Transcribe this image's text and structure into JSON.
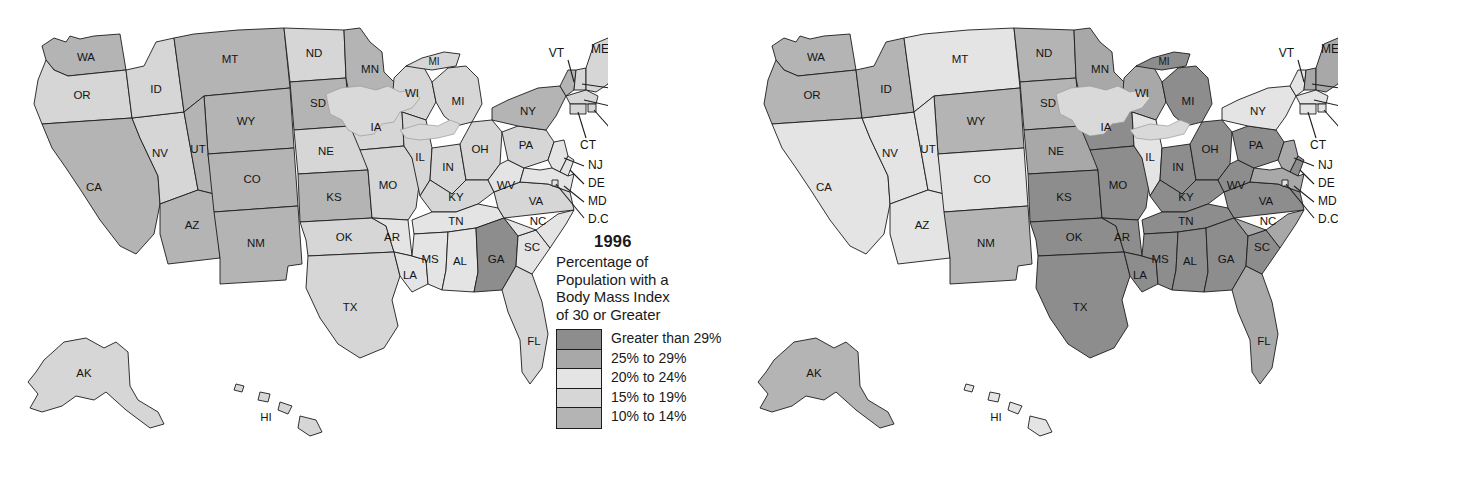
{
  "figure": {
    "background": "#ffffff",
    "border_color": "#1c1c1c"
  },
  "legend": {
    "title_lines": [
      "Percentage of",
      "Population with a",
      "Body Mass Index",
      "of 30 or Greater"
    ],
    "title_text": "Percentage of Population with a Body Mass Index of 30 or Greater",
    "bins": [
      {
        "label": "Greater than 29%",
        "color": "#8d8d8d",
        "key": "gt29"
      },
      {
        "label": "25% to 29%",
        "color": "#a8a8a8",
        "key": "b25_29"
      },
      {
        "label": "20% to 24%",
        "color": "#e4e4e4",
        "key": "b20_24"
      },
      {
        "label": "15% to 19%",
        "color": "#d6d6d6",
        "key": "b15_19"
      },
      {
        "label": "10% to 14%",
        "color": "#b4b4b4",
        "key": "b10_14"
      }
    ]
  },
  "panels": [
    {
      "id": "map-1996",
      "year": "1996"
    },
    {
      "id": "map-2010",
      "year": "2010"
    }
  ],
  "chart_data": {
    "type": "map",
    "title": "Percentage of Population with a Body Mass Index of 30 or Greater",
    "maps": [
      {
        "year": "1996",
        "values": {
          "AL": "20% to 24%",
          "AK": "15% to 19%",
          "AZ": "10% to 14%",
          "AR": "20% to 24%",
          "CA": "10% to 14%",
          "CO": "10% to 14%",
          "CT": "15% to 19%",
          "DE": "20% to 24%",
          "DC": "20% to 24%",
          "FL": "15% to 19%",
          "GA": "Greater than 29%",
          "HI": "15% to 19%",
          "ID": "15% to 19%",
          "IL": "15% to 19%",
          "IN": "15% to 19%",
          "IA": "15% to 19%",
          "KS": "10% to 14%",
          "KY": "15% to 19%",
          "LA": "20% to 24%",
          "ME": "15% to 19%",
          "MD": "20% to 24%",
          "MA": "15% to 19%",
          "MI": "15% to 19%",
          "MN": "10% to 14%",
          "MS": "20% to 24%",
          "MO": "15% to 19%",
          "MT": "10% to 14%",
          "NE": "15% to 19%",
          "NV": "15% to 19%",
          "NH": "15% to 19%",
          "NJ": "20% to 24%",
          "NM": "10% to 14%",
          "NY": "10% to 14%",
          "NC": "20% to 24%",
          "ND": "15% to 19%",
          "OH": "15% to 19%",
          "OK": "15% to 19%",
          "OR": "15% to 19%",
          "PA": "15% to 19%",
          "RI": "15% to 19%",
          "SC": "20% to 24%",
          "SD": "10% to 14%",
          "TN": "20% to 24%",
          "TX": "15% to 19%",
          "UT": "10% to 14%",
          "VT": "10% to 14%",
          "VA": "15% to 19%",
          "WA": "10% to 14%",
          "WV": "20% to 24%",
          "WI": "15% to 19%",
          "WY": "10% to 14%"
        }
      },
      {
        "year": "2010",
        "values": {
          "AL": "Greater than 29%",
          "AK": "10% to 14%",
          "AZ": "20% to 24%",
          "AR": "Greater than 29%",
          "CA": "20% to 24%",
          "CO": "20% to 24%",
          "CT": "20% to 24%",
          "DE": "Greater than 29%",
          "DC": "20% to 24%",
          "FL": "25% to 29%",
          "GA": "Greater than 29%",
          "HI": "20% to 24%",
          "ID": "10% to 14%",
          "IL": "20% to 24%",
          "IN": "Greater than 29%",
          "IA": "Greater than 29%",
          "KS": "Greater than 29%",
          "KY": "Greater than 29%",
          "LA": "Greater than 29%",
          "ME": "25% to 29%",
          "MD": "25% to 29%",
          "MA": "20% to 24%",
          "MI": "Greater than 29%",
          "MN": "25% to 29%",
          "MS": "Greater than 29%",
          "MO": "Greater than 29%",
          "MT": "20% to 24%",
          "NE": "25% to 29%",
          "NV": "20% to 24%",
          "NH": "25% to 29%",
          "NJ": "25% to 29%",
          "NM": "10% to 14%",
          "NY": "20% to 24%",
          "NC": "25% to 29%",
          "ND": "10% to 14%",
          "OH": "Greater than 29%",
          "OK": "Greater than 29%",
          "OR": "10% to 14%",
          "PA": "Greater than 29%",
          "RI": "20% to 24%",
          "SC": "Greater than 29%",
          "SD": "10% to 14%",
          "TN": "Greater than 29%",
          "TX": "Greater than 29%",
          "UT": "20% to 24%",
          "VT": "20% to 24%",
          "VA": "Greater than 29%",
          "WA": "10% to 14%",
          "WV": "Greater than 29%",
          "WI": "25% to 29%",
          "WY": "10% to 14%"
        }
      }
    ],
    "state_labels": [
      "WA",
      "OR",
      "CA",
      "NV",
      "ID",
      "MT",
      "WY",
      "UT",
      "AZ",
      "CO",
      "NM",
      "ND",
      "SD",
      "NE",
      "KS",
      "OK",
      "TX",
      "MN",
      "IA",
      "MO",
      "AR",
      "LA",
      "WI",
      "IL",
      "MI",
      "IN",
      "OH",
      "KY",
      "TN",
      "MS",
      "AL",
      "GA",
      "FL",
      "SC",
      "NC",
      "VA",
      "WV",
      "PA",
      "NY",
      "VT",
      "NH",
      "ME",
      "MA",
      "RI",
      "CT",
      "NJ",
      "DE",
      "MD",
      "D.C.",
      "AK",
      "HI"
    ]
  }
}
